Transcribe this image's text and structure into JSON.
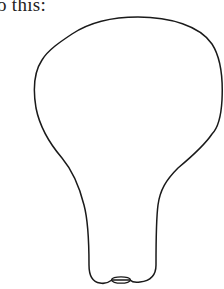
{
  "caption": {
    "text": "o this:"
  },
  "figure": {
    "stroke_color": "#1a1a1a",
    "background_color": "#ffffff"
  }
}
